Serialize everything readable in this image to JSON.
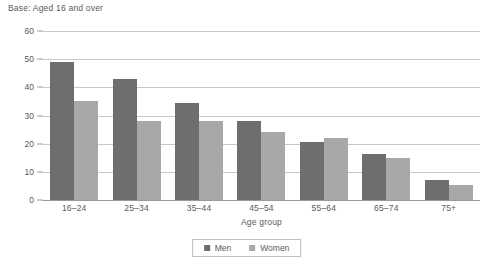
{
  "base_note": "Base: Aged 16 and over",
  "legend": {
    "items": [
      {
        "label": "Men",
        "color": "#6e6e6e"
      },
      {
        "label": "Women",
        "color": "#a8a8a8"
      }
    ]
  },
  "chart_data": {
    "type": "bar",
    "title": "",
    "subtitle": "Base: Aged 16 and over",
    "xlabel": "Age group",
    "ylabel": "Per cent",
    "categories": [
      "16–24",
      "25–34",
      "35–44",
      "45–54",
      "55–64",
      "65–74",
      "75+"
    ],
    "series": [
      {
        "name": "Men",
        "color": "#6e6e6e",
        "values": [
          49,
          43,
          34.5,
          28,
          20.5,
          16.5,
          7
        ]
      },
      {
        "name": "Women",
        "color": "#a8a8a8",
        "values": [
          35,
          28,
          28,
          24,
          22,
          15,
          5.5
        ]
      }
    ],
    "ylim": [
      0,
      60
    ],
    "yticks": [
      0,
      10,
      20,
      30,
      40,
      50,
      60
    ],
    "ytick_labels": [
      "0",
      "10",
      "20",
      "30",
      "40",
      "50",
      "60"
    ],
    "grid": true,
    "grid_axis": "y",
    "legend_position": "bottom"
  }
}
